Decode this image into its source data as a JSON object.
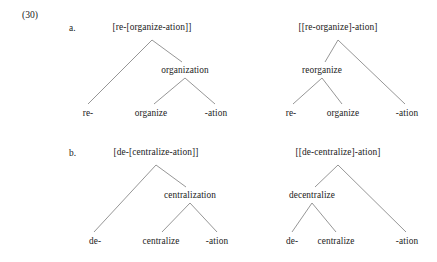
{
  "figure": {
    "example_number": "(30)",
    "background_color": "#ffffff",
    "text_color": "#222222",
    "line_color": "#8a8a8a"
  },
  "rows": [
    {
      "marker": "a.",
      "trees": [
        {
          "id": "a-left",
          "bracketing": "[re-[organize-ation]]",
          "root_label": "[re-[organize-ation]]",
          "mid_label": "organization",
          "leaves": [
            "re-",
            "organize",
            "-ation"
          ],
          "structure": "left-prefix-outer"
        },
        {
          "id": "a-right",
          "bracketing": "[[re-organize]-ation]",
          "root_label": "[[re-organize]-ation]",
          "mid_label": "reorganize",
          "leaves": [
            "re-",
            "organize",
            "-ation"
          ],
          "structure": "right-suffix-outer"
        }
      ]
    },
    {
      "marker": "b.",
      "trees": [
        {
          "id": "b-left",
          "bracketing": "[de-[centralize-ation]]",
          "root_label": "[de-[centralize-ation]]",
          "mid_label": "centralization",
          "leaves": [
            "de-",
            "centralize",
            "-ation"
          ],
          "structure": "left-prefix-outer"
        },
        {
          "id": "b-right",
          "bracketing": "[[de-centralize]-ation]",
          "root_label": "[[de-centralize]-ation]",
          "mid_label": "decentralize",
          "leaves": [
            "de-",
            "centralize",
            "-ation"
          ],
          "structure": "right-suffix-outer"
        }
      ]
    }
  ]
}
